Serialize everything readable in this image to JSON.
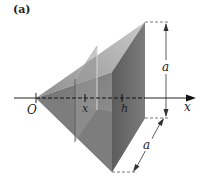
{
  "figure": {
    "tag": "(a)",
    "labels": {
      "origin": "O",
      "x_mark": "x",
      "h_mark": "h",
      "axis": "x",
      "height_dim": "a",
      "depth_dim": "a"
    }
  },
  "colors": {
    "top_face": "#a8a8a8",
    "left_face": "#7a7a7a",
    "bottom_face": "#8c8c8c",
    "base_face": "#6a6a6a",
    "section": "#959595",
    "line": "#222222",
    "dash": "#555555"
  }
}
